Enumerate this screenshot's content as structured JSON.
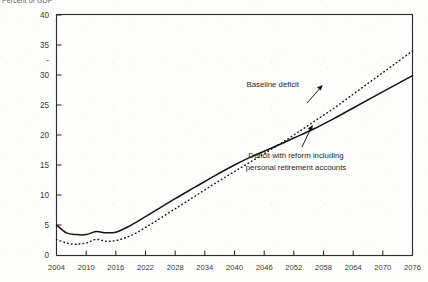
{
  "figure": {
    "axis_unit_label": "Percent of GDP"
  },
  "chart_data": {
    "type": "line",
    "title": "",
    "subtitle": "",
    "xlabel": "",
    "ylabel": "Percent of GDP",
    "xlim": [
      2004,
      2076
    ],
    "ylim": [
      0,
      40
    ],
    "grid": false,
    "legend_position": "inline-annotations",
    "xticks": [
      "2004",
      "2010",
      "2016",
      "2022",
      "2028",
      "2034",
      "2040",
      "2046",
      "2052",
      "2058",
      "2064",
      "2070",
      "2076"
    ],
    "yticks": [
      "40",
      "35",
      "-",
      "30",
      "25",
      "20",
      "15",
      "10",
      "5",
      "0"
    ],
    "ytick_values": [
      40,
      35,
      30,
      25,
      20,
      15,
      10,
      5,
      0
    ],
    "x": [
      2004,
      2006,
      2008,
      2010,
      2012,
      2014,
      2016,
      2018,
      2020,
      2022,
      2024,
      2028,
      2032,
      2036,
      2040,
      2044,
      2048,
      2052,
      2056,
      2060,
      2064,
      2068,
      2072,
      2076
    ],
    "series": [
      {
        "name": "Baseline deficit",
        "style": "dotted",
        "color": "#141414",
        "values": [
          2.6,
          2.0,
          1.8,
          2.0,
          2.6,
          2.3,
          2.4,
          2.9,
          3.6,
          4.6,
          5.6,
          7.7,
          9.8,
          11.9,
          13.9,
          15.9,
          17.9,
          20.0,
          22.2,
          24.4,
          26.8,
          29.2,
          31.6,
          34.0
        ]
      },
      {
        "name": "Deficit with reform including personal retirement accounts",
        "style": "solid",
        "color": "#141414",
        "values": [
          5.0,
          3.7,
          3.4,
          3.4,
          3.9,
          3.7,
          3.8,
          4.5,
          5.4,
          6.4,
          7.4,
          9.4,
          11.3,
          13.2,
          15.0,
          16.6,
          18.0,
          19.5,
          21.0,
          22.7,
          24.5,
          26.3,
          28.1,
          29.9
        ]
      }
    ],
    "annotations": [
      {
        "id": "baseline-annotation",
        "text": "Baseline deficit",
        "lines": [
          "Baseline deficit"
        ],
        "points_to": "Baseline deficit"
      },
      {
        "id": "reform-annotation",
        "text": "Deficit with reform including personal retirement accounts",
        "lines": [
          "Deficit with reform including",
          "personal retirement accounts"
        ],
        "points_to": "Deficit with reform including personal retirement accounts"
      }
    ]
  }
}
